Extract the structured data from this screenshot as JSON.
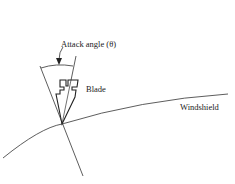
{
  "labels": {
    "attack_angle": "Attack angle (θ)",
    "blade": "Blade",
    "windshield": "Windshield"
  },
  "colors": {
    "stroke": "#222222",
    "background": "#ffffff"
  }
}
